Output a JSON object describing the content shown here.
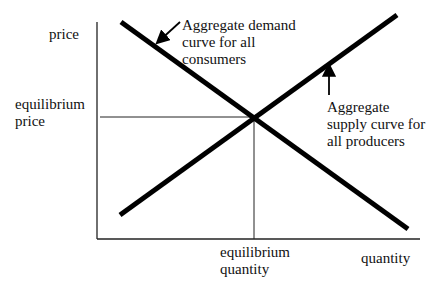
{
  "diagram": {
    "type": "supply-demand",
    "axes": {
      "y_label": "price",
      "x_label": "quantity"
    },
    "equilibrium": {
      "price_label": [
        "equilibrium",
        "price"
      ],
      "quantity_label": [
        "equilibrium",
        "quantity"
      ]
    },
    "curves": {
      "demand": {
        "label": [
          "Aggregate demand",
          "curve for all",
          "consumers"
        ],
        "direction": "downward-sloping"
      },
      "supply": {
        "label": [
          "Aggregate",
          "supply curve for",
          "all producers"
        ],
        "direction": "upward-sloping"
      }
    },
    "colors": {
      "line": "#000000",
      "text": "#111111"
    }
  }
}
